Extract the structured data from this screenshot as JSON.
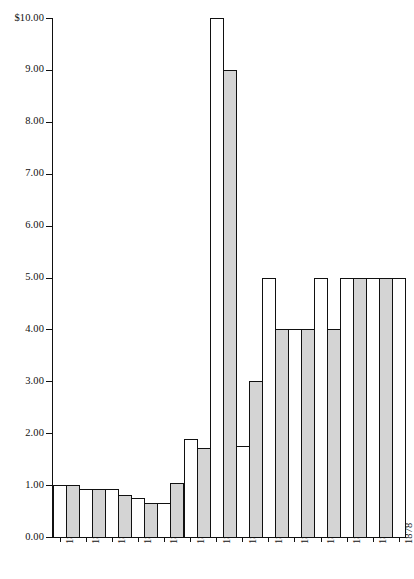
{
  "chart_data": {
    "type": "bar",
    "title": "",
    "xlabel": "",
    "ylabel": "",
    "ylim": [
      0,
      10
    ],
    "grid": false,
    "legend": "none",
    "y_ticks": [
      {
        "value": 10,
        "label": "$10.00"
      },
      {
        "value": 9,
        "label": "9.00"
      },
      {
        "value": 8,
        "label": "8.00"
      },
      {
        "value": 7,
        "label": "7.00"
      },
      {
        "value": 6,
        "label": "6.00"
      },
      {
        "value": 5,
        "label": "5.00"
      },
      {
        "value": 4,
        "label": "4.00"
      },
      {
        "value": 3,
        "label": "3.00"
      },
      {
        "value": 2,
        "label": "2.00"
      },
      {
        "value": 1,
        "label": "1.00"
      },
      {
        "value": 0,
        "label": "0.00"
      }
    ],
    "x_tick_labels": [
      "1852",
      "1854",
      "1856",
      "1858",
      "1860",
      "1862",
      "1864",
      "1866",
      "1868",
      "1870",
      "1872",
      "1874",
      "1876",
      "1878"
    ],
    "categories": [
      "1852",
      "1853",
      "1854",
      "1855",
      "1856",
      "1857",
      "1858",
      "1859",
      "1860",
      "1861",
      "1862",
      "1863",
      "1864",
      "1865",
      "1866",
      "1867",
      "1868",
      "1869",
      "1870",
      "1871",
      "1872",
      "1873",
      "1874",
      "1875",
      "1876",
      "1877",
      "1878"
    ],
    "values": [
      1.0,
      1.0,
      0.92,
      0.92,
      0.92,
      0.8,
      0.75,
      0.65,
      0.65,
      1.05,
      1.88,
      1.72,
      10.0,
      9.0,
      1.75,
      3.0,
      5.0,
      4.0,
      4.0,
      4.0,
      5.0,
      4.0,
      5.0,
      5.0,
      5.0,
      5.0,
      5.0
    ],
    "bar_fills": [
      "white",
      "gray",
      "white",
      "gray",
      "white",
      "gray",
      "white",
      "gray",
      "white",
      "gray",
      "white",
      "gray",
      "white",
      "gray",
      "white",
      "gray",
      "white",
      "gray",
      "white",
      "gray",
      "white",
      "gray",
      "white",
      "gray",
      "white",
      "gray",
      "white"
    ],
    "colors": {
      "bar_white": "#ffffff",
      "bar_gray": "#d4d4d4",
      "outline": "#111111",
      "axis": "#111111",
      "background": "#ffffff"
    }
  }
}
